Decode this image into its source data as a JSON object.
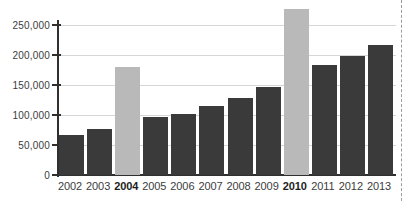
{
  "chart_data": {
    "type": "bar",
    "title": "",
    "subtitle": "",
    "xlabel": "",
    "ylabel": "",
    "categories": [
      "2002",
      "2003",
      "2004",
      "2005",
      "2006",
      "2007",
      "2008",
      "2009",
      "2010",
      "2011",
      "2012",
      "2013"
    ],
    "values": [
      67000,
      76000,
      180000,
      96000,
      101000,
      115000,
      128000,
      146000,
      277000,
      184000,
      199000,
      217000
    ],
    "series": [
      {
        "name": "Value",
        "values": [
          67000,
          76000,
          180000,
          96000,
          101000,
          115000,
          128000,
          146000,
          277000,
          184000,
          199000,
          217000
        ]
      }
    ],
    "highlighted_categories": [
      "2004",
      "2010"
    ],
    "bar_colors": [
      "dark",
      "dark",
      "light",
      "dark",
      "dark",
      "dark",
      "dark",
      "dark",
      "light",
      "dark",
      "dark",
      "dark"
    ],
    "ylim": [
      0,
      250000
    ],
    "yticks": [
      0,
      50000,
      100000,
      150000,
      200000,
      250000
    ],
    "ytick_labels": [
      "0",
      "50,000",
      "100,000",
      "150,000",
      "200,000",
      "250,000"
    ],
    "xtick_labels": [
      "2002",
      "2003",
      "2004",
      "2005",
      "2006",
      "2007",
      "2008",
      "2009",
      "2010",
      "2011",
      "2012",
      "2013"
    ],
    "grid": true,
    "legend": null,
    "legend_position": "none",
    "annotations": [],
    "colors": {
      "bar_dark": "#3a3a3a",
      "bar_light": "#b9b9b9",
      "axis": "#2f2f2f",
      "gridline": "#d6d6d6",
      "text": "#3c3c3c",
      "page_edge": "#9a9aa2",
      "background": "#ffffff"
    }
  }
}
